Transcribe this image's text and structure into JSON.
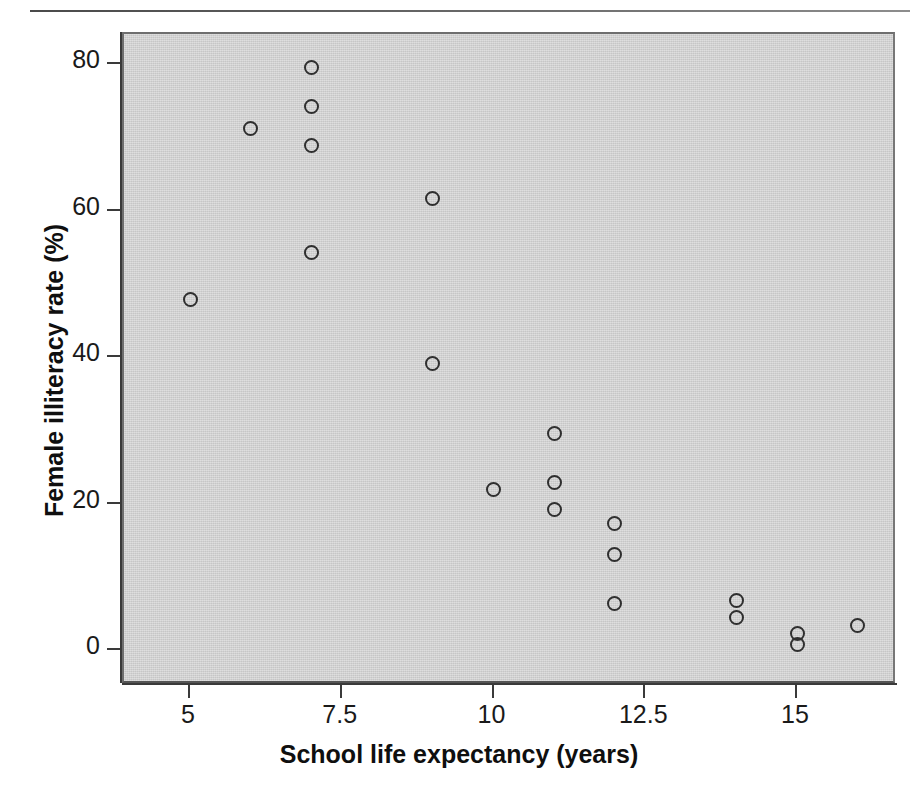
{
  "chart_data": {
    "type": "scatter",
    "title": "",
    "xlabel": "School life expectancy (years)",
    "ylabel": "Female illiteracy rate (%)",
    "xlim": [
      3.6,
      16.7
    ],
    "ylim": [
      -2.5,
      84
    ],
    "xticks": [
      5,
      7.5,
      10,
      12.5,
      15
    ],
    "xtick_labels": [
      "5",
      "7.5",
      "10",
      "12.5",
      "15"
    ],
    "yticks": [
      0,
      20,
      40,
      60,
      80
    ],
    "ytick_labels": [
      "0",
      "20",
      "40",
      "60",
      "80"
    ],
    "grid": false,
    "legend": null,
    "marker": "open-circle",
    "marker_color": "#2f2f2f",
    "plot_background": "#d4d4d4",
    "points": [
      {
        "x": 5,
        "y": 47.8
      },
      {
        "x": 6,
        "y": 71.2
      },
      {
        "x": 7,
        "y": 79.5
      },
      {
        "x": 7,
        "y": 74.2
      },
      {
        "x": 7,
        "y": 68.9
      },
      {
        "x": 7,
        "y": 54.2
      },
      {
        "x": 9,
        "y": 61.7
      },
      {
        "x": 9,
        "y": 39.1
      },
      {
        "x": 10,
        "y": 21.9
      },
      {
        "x": 11,
        "y": 29.6
      },
      {
        "x": 11,
        "y": 22.8
      },
      {
        "x": 11,
        "y": 19.2
      },
      {
        "x": 12,
        "y": 17.3
      },
      {
        "x": 12,
        "y": 13.0
      },
      {
        "x": 12,
        "y": 6.3
      },
      {
        "x": 14,
        "y": 6.7
      },
      {
        "x": 14,
        "y": 4.5
      },
      {
        "x": 15,
        "y": 2.2
      },
      {
        "x": 15,
        "y": 0.8
      },
      {
        "x": 16,
        "y": 3.4
      }
    ]
  }
}
